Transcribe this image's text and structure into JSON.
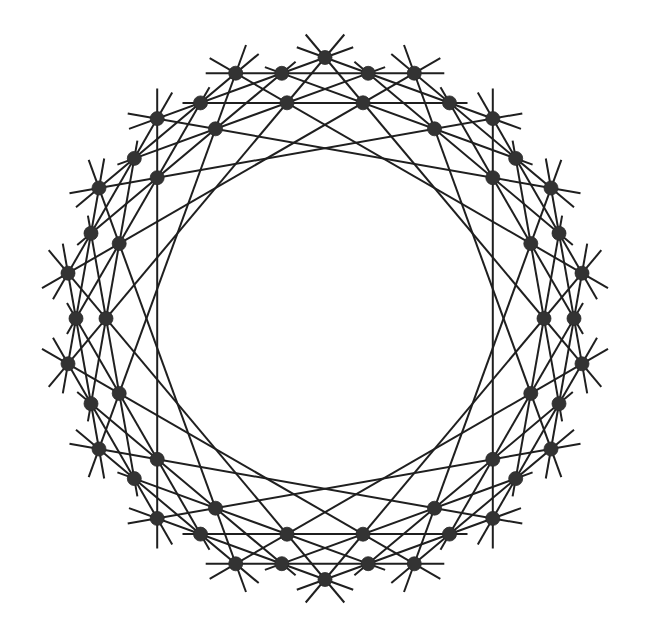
{
  "diagram": {
    "type": "point-line configuration",
    "center": [
      325,
      318.5
    ],
    "colors": {
      "background": "#ffffff",
      "line": "#1f1f1f",
      "point": "#333333"
    },
    "point_radius": 7,
    "line_width": 2,
    "rings": [
      {
        "id": "O",
        "name": "outer",
        "count": 18,
        "radius": 261,
        "start_angle_deg": 10,
        "step_deg": 20
      },
      {
        "id": "M",
        "name": "middle",
        "count": 18,
        "radius": 249,
        "start_angle_deg": 0,
        "step_deg": 20
      },
      {
        "id": "I",
        "name": "inner",
        "count": 18,
        "radius": 219,
        "start_angle_deg": 0,
        "step_deg": 20
      }
    ],
    "points": {
      "O0": [
        582.0,
        363.8
      ],
      "O1": [
        551.0,
        449.0
      ],
      "O2": [
        492.8,
        518.4
      ],
      "O3": [
        414.3,
        563.8
      ],
      "O4": [
        325.0,
        579.5
      ],
      "O5": [
        235.7,
        563.8
      ],
      "O6": [
        157.2,
        518.4
      ],
      "O7": [
        99.0,
        449.0
      ],
      "O8": [
        68.0,
        363.8
      ],
      "O9": [
        68.0,
        273.2
      ],
      "O10": [
        99.0,
        188.0
      ],
      "O11": [
        157.2,
        118.6
      ],
      "O12": [
        235.7,
        73.2
      ],
      "O13": [
        325.0,
        57.5
      ],
      "O14": [
        414.3,
        73.2
      ],
      "O15": [
        492.8,
        118.6
      ],
      "O16": [
        551.0,
        188.0
      ],
      "O17": [
        582.0,
        273.2
      ],
      "M0": [
        574.0,
        318.5
      ],
      "M1": [
        559.0,
        403.7
      ],
      "M2": [
        515.7,
        478.6
      ],
      "M3": [
        449.5,
        534.1
      ],
      "M4": [
        368.2,
        563.7
      ],
      "M5": [
        281.8,
        563.7
      ],
      "M6": [
        200.5,
        534.1
      ],
      "M7": [
        134.3,
        478.6
      ],
      "M8": [
        91.0,
        403.7
      ],
      "M9": [
        76.0,
        318.5
      ],
      "M10": [
        91.0,
        233.3
      ],
      "M11": [
        134.3,
        158.4
      ],
      "M12": [
        200.5,
        102.9
      ],
      "M13": [
        281.8,
        73.3
      ],
      "M14": [
        368.2,
        73.3
      ],
      "M15": [
        449.5,
        102.9
      ],
      "M16": [
        515.7,
        158.4
      ],
      "M17": [
        559.0,
        233.3
      ],
      "I0": [
        544.0,
        318.5
      ],
      "I1": [
        530.8,
        393.4
      ],
      "I2": [
        492.8,
        459.3
      ],
      "I3": [
        434.5,
        508.2
      ],
      "I4": [
        363.0,
        534.2
      ],
      "I5": [
        287.0,
        534.2
      ],
      "I6": [
        215.5,
        508.2
      ],
      "I7": [
        157.2,
        459.3
      ],
      "I8": [
        119.2,
        393.4
      ],
      "I9": [
        106.0,
        318.5
      ],
      "I10": [
        119.2,
        243.6
      ],
      "I11": [
        157.2,
        177.7
      ],
      "I12": [
        215.5,
        128.8
      ],
      "I13": [
        287.0,
        102.8
      ],
      "I14": [
        363.0,
        102.8
      ],
      "I15": [
        434.5,
        128.8
      ],
      "I16": [
        492.8,
        177.7
      ],
      "I17": [
        530.8,
        243.6
      ]
    },
    "line_families": [
      {
        "name": "outer-inner-inner-outer",
        "extension": 30,
        "lines": [
          [
            "O15",
            "I16",
            "I2",
            "O2"
          ],
          [
            "O16",
            "I17",
            "I3",
            "O3"
          ],
          [
            "O17",
            "I0",
            "I4",
            "O4"
          ],
          [
            "O0",
            "I1",
            "I5",
            "O5"
          ],
          [
            "O1",
            "I2",
            "I6",
            "O6"
          ],
          [
            "O2",
            "I3",
            "I7",
            "O7"
          ],
          [
            "O3",
            "I4",
            "I8",
            "O8"
          ],
          [
            "O4",
            "I5",
            "I9",
            "O9"
          ],
          [
            "O5",
            "I6",
            "I10",
            "O10"
          ],
          [
            "O6",
            "I7",
            "I11",
            "O11"
          ],
          [
            "O7",
            "I8",
            "I12",
            "O12"
          ],
          [
            "O8",
            "I9",
            "I13",
            "O13"
          ],
          [
            "O9",
            "I10",
            "I14",
            "O14"
          ],
          [
            "O10",
            "I11",
            "I15",
            "O15"
          ],
          [
            "O11",
            "I12",
            "I16",
            "O16"
          ],
          [
            "O12",
            "I13",
            "I17",
            "O17"
          ],
          [
            "O13",
            "I14",
            "I0",
            "O0"
          ],
          [
            "O14",
            "I15",
            "I1",
            "O1"
          ]
        ]
      },
      {
        "name": "outer-middle-middle-outer",
        "extension": 30,
        "lines": [
          [
            "O17",
            "M0",
            "M1",
            "O1"
          ],
          [
            "O0",
            "M1",
            "M2",
            "O2"
          ],
          [
            "O1",
            "M2",
            "M3",
            "O3"
          ],
          [
            "O2",
            "M3",
            "M4",
            "O4"
          ],
          [
            "O3",
            "M4",
            "M5",
            "O5"
          ],
          [
            "O4",
            "M5",
            "M6",
            "O6"
          ],
          [
            "O5",
            "M6",
            "M7",
            "O7"
          ],
          [
            "O6",
            "M7",
            "M8",
            "O8"
          ],
          [
            "O7",
            "M8",
            "M9",
            "O9"
          ],
          [
            "O8",
            "M9",
            "M10",
            "O10"
          ],
          [
            "O9",
            "M10",
            "M11",
            "O11"
          ],
          [
            "O10",
            "M11",
            "M12",
            "O12"
          ],
          [
            "O11",
            "M12",
            "M13",
            "O13"
          ],
          [
            "O12",
            "M13",
            "M14",
            "O14"
          ],
          [
            "O13",
            "M14",
            "M15",
            "O15"
          ],
          [
            "O14",
            "M15",
            "M16",
            "O16"
          ],
          [
            "O15",
            "M16",
            "M17",
            "O17"
          ],
          [
            "O16",
            "M17",
            "M0",
            "O0"
          ]
        ]
      },
      {
        "name": "middle-inner-inner-middle",
        "extension": 18,
        "lines": [
          [
            "M17",
            "I0",
            "I1",
            "M2"
          ],
          [
            "M0",
            "I1",
            "I2",
            "M3"
          ],
          [
            "M1",
            "I2",
            "I3",
            "M4"
          ],
          [
            "M2",
            "I3",
            "I4",
            "M5"
          ],
          [
            "M3",
            "I4",
            "I5",
            "M6"
          ],
          [
            "M4",
            "I5",
            "I6",
            "M7"
          ],
          [
            "M5",
            "I6",
            "I7",
            "M8"
          ],
          [
            "M6",
            "I7",
            "I8",
            "M9"
          ],
          [
            "M7",
            "I8",
            "I9",
            "M10"
          ],
          [
            "M8",
            "I9",
            "I10",
            "M11"
          ],
          [
            "M9",
            "I10",
            "I11",
            "M12"
          ],
          [
            "M10",
            "I11",
            "I12",
            "M13"
          ],
          [
            "M11",
            "I12",
            "I13",
            "M14"
          ],
          [
            "M12",
            "I13",
            "I14",
            "M15"
          ],
          [
            "M13",
            "I14",
            "I15",
            "M16"
          ],
          [
            "M14",
            "I15",
            "I16",
            "M17"
          ],
          [
            "M15",
            "I16",
            "I17",
            "M0"
          ],
          [
            "M16",
            "I17",
            "I0",
            "M1"
          ]
        ]
      }
    ]
  }
}
